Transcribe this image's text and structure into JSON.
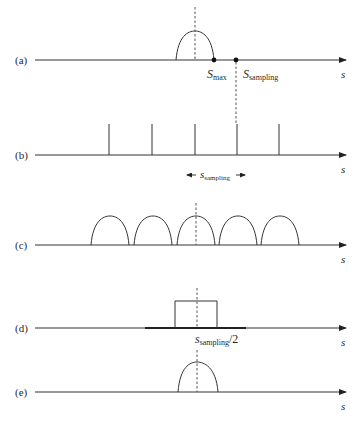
{
  "figure": {
    "panels": [
      {
        "id": "a",
        "label": "(a)",
        "axis_label": "s",
        "description": "single spectrum bump centered at origin"
      },
      {
        "id": "b",
        "label": "(b)",
        "axis_label": "s",
        "description": "impulse train spaced s_sampling"
      },
      {
        "id": "c",
        "label": "(c)",
        "axis_label": "s",
        "description": "replicated spectra after sampling"
      },
      {
        "id": "d",
        "label": "(d)",
        "axis_label": "s",
        "description": "ideal low-pass box filter"
      },
      {
        "id": "e",
        "label": "(e)",
        "axis_label": "s",
        "description": "recovered spectrum"
      }
    ],
    "annotations": {
      "s_max": {
        "main": "S",
        "sub": "max"
      },
      "s_sampling_a": {
        "main": "S",
        "sub": "sampling"
      },
      "s_sampling_b": {
        "main": "s",
        "sub": "sampling",
        "arrows": "double"
      },
      "cutoff_d": {
        "main": "s",
        "sub": "sampling",
        "suffix": "/2"
      }
    }
  }
}
